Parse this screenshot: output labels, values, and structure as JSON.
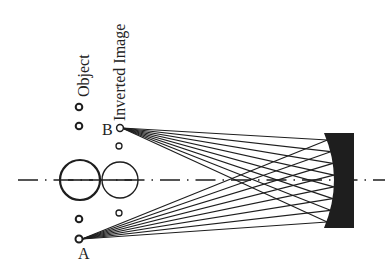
{
  "diagram": {
    "labels": {
      "object": "Object",
      "inverted_image": "Inverted Image",
      "point_a": "A",
      "point_b": "B"
    },
    "colors": {
      "ink": "#1e1e1e",
      "background": "#ffffff"
    },
    "optical_axis": {
      "y": 180,
      "x_start": 18,
      "x_end": 385
    },
    "object_points": [
      {
        "x": 79,
        "y": 107,
        "r": 3.5
      },
      {
        "x": 79,
        "y": 126,
        "r": 3.5
      },
      {
        "x": 79,
        "y": 219,
        "r": 3.5
      },
      {
        "x": 79,
        "y": 239,
        "r": 3.5,
        "label": "A"
      }
    ],
    "image_points": [
      {
        "x": 120,
        "y": 128,
        "r": 3.5,
        "label": "B"
      },
      {
        "x": 119,
        "y": 146,
        "r": 3
      },
      {
        "x": 119,
        "y": 213,
        "r": 3
      }
    ],
    "object_circle": {
      "cx": 80,
      "cy": 180,
      "r": 20
    },
    "image_circle": {
      "cx": 120,
      "cy": 180,
      "r": 18
    },
    "mirror": {
      "x_left_edge": 325,
      "x_center": 334,
      "x_right": 354,
      "y_top": 133,
      "y_bottom": 228
    },
    "ray_count_per_point": 8
  }
}
